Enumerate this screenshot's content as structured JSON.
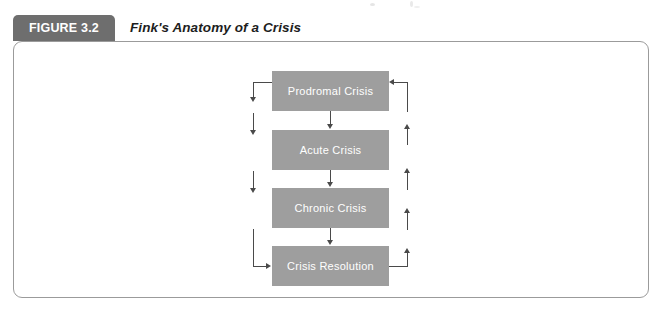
{
  "figure": {
    "tab_label": "FIGURE 3.2",
    "title": "Fink's Anatomy of a Crisis"
  },
  "colors": {
    "tab_bg": "#6e6e6e",
    "tab_text": "#ffffff",
    "panel_border": "#9b9b9b",
    "node_bg": "#9e9e9e",
    "node_text": "#ffffff",
    "connector": "#4a4a4a",
    "page_bg": "#ffffff"
  },
  "diagram": {
    "type": "flowchart",
    "orientation": "vertical-cycle",
    "nodes": [
      {
        "id": "prodromal",
        "label": "Prodromal Crisis"
      },
      {
        "id": "acute",
        "label": "Acute Crisis"
      },
      {
        "id": "chronic",
        "label": "Chronic Crisis"
      },
      {
        "id": "resolution",
        "label": "Crisis Resolution"
      }
    ],
    "edges": [
      {
        "from": "prodromal",
        "to": "acute",
        "style": "straight-down"
      },
      {
        "from": "acute",
        "to": "chronic",
        "style": "straight-down"
      },
      {
        "from": "chronic",
        "to": "resolution",
        "style": "straight-down"
      },
      {
        "from": "prodromal",
        "to": "resolution",
        "style": "left-return-down"
      },
      {
        "from": "resolution",
        "to": "prodromal",
        "style": "right-return-up"
      }
    ]
  }
}
